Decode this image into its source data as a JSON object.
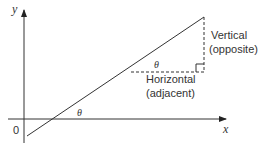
{
  "diagram": {
    "axes": {
      "x_label": "x",
      "y_label": "y",
      "origin_label": "0"
    },
    "angles": {
      "at_axis": "θ",
      "in_triangle": "θ"
    },
    "labels": {
      "vertical_line1": "Vertical",
      "vertical_line2": "(opposite)",
      "horizontal_line1": "Horizontal",
      "horizontal_line2": "(adjacent)"
    },
    "colors": {
      "line": "#333333",
      "dashed": "#333333",
      "text": "#333333"
    }
  }
}
